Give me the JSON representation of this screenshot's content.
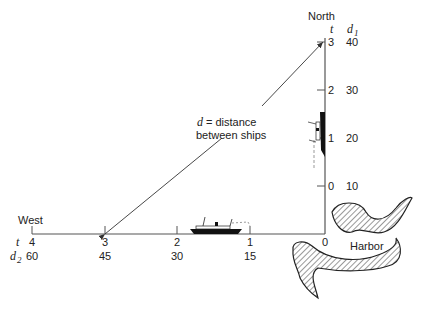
{
  "diagram": {
    "west_label": "West",
    "north_label": "North",
    "harbor_label": "Harbor",
    "distance_label_1": "= distance",
    "distance_var": "d",
    "distance_label_2": "between ships",
    "west_axis": {
      "t_label": "t",
      "d_label": "d",
      "d_sub": "2",
      "ticks": [
        {
          "t": "4",
          "d": "60"
        },
        {
          "t": "3",
          "d": "45"
        },
        {
          "t": "2",
          "d": "30"
        },
        {
          "t": "1",
          "d": "15"
        },
        {
          "t": "0",
          "d": ""
        }
      ]
    },
    "north_axis": {
      "t_label": "t",
      "d_label": "d",
      "d_sub": "1",
      "ticks": [
        {
          "t": "3",
          "d": "40"
        },
        {
          "t": "2",
          "d": "30"
        },
        {
          "t": "1",
          "d": "20"
        },
        {
          "t": "0",
          "d": "10"
        }
      ]
    },
    "colors": {
      "ink": "#222222",
      "axis": "#555555"
    }
  }
}
